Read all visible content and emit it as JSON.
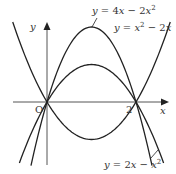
{
  "diagram": {
    "axes": {
      "x_label": "x",
      "y_label": "y",
      "origin_label": "O",
      "tick_label_2": "2"
    },
    "curves": [
      {
        "id": "curve-a",
        "label": "y = 4x − 2x²",
        "label_parts": [
          "y",
          " = 4",
          "x",
          " − 2",
          "x",
          "2"
        ],
        "a": -2,
        "b": 4,
        "c": 0
      },
      {
        "id": "curve-b",
        "label": "y = x² − 2x",
        "label_parts": [
          "y",
          " = ",
          "x",
          "2",
          " − 2",
          "x"
        ],
        "a": 1,
        "b": -2,
        "c": 0
      },
      {
        "id": "curve-c",
        "label": "y = 2x − x²",
        "label_parts": [
          "y",
          " = 2",
          "x",
          " − ",
          "x",
          "2"
        ],
        "a": -1,
        "b": 2,
        "c": 0
      }
    ],
    "colors": {
      "curve": "#222222",
      "axis": "#444444",
      "text": "#333333"
    }
  }
}
